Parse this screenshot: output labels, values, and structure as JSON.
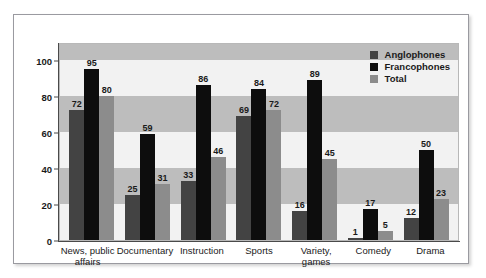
{
  "chart_data": {
    "type": "bar",
    "title": "",
    "xlabel": "",
    "ylabel": "",
    "ylim": [
      0,
      110
    ],
    "yticks": [
      0,
      20,
      40,
      60,
      80,
      100
    ],
    "grid": "horizontal-bands",
    "legend_position": "top-right",
    "categories": [
      "News, public affairs",
      "Documentary",
      "Instruction",
      "Sports",
      "Variety, games",
      "Comedy",
      "Drama"
    ],
    "category_lines": [
      [
        "News, public",
        "affairs"
      ],
      [
        "Documentary"
      ],
      [
        "Instruction"
      ],
      [
        "Sports"
      ],
      [
        "Variety,",
        "games"
      ],
      [
        "Comedy"
      ],
      [
        "Drama"
      ]
    ],
    "series": [
      {
        "name": "Anglophones",
        "color": "#434343",
        "values": [
          72,
          25,
          33,
          69,
          16,
          1,
          12
        ]
      },
      {
        "name": "Francophones",
        "color": "#0d0d0d",
        "values": [
          95,
          59,
          86,
          84,
          89,
          17,
          50
        ]
      },
      {
        "name": "Total",
        "color": "#8c8c8c",
        "values": [
          80,
          31,
          46,
          72,
          45,
          5,
          23
        ]
      }
    ]
  },
  "legend": {
    "items": [
      {
        "label": "Anglophones",
        "color": "#434343"
      },
      {
        "label": "Francophones",
        "color": "#0d0d0d"
      },
      {
        "label": "Total",
        "color": "#8c8c8c"
      }
    ]
  },
  "axis": {
    "y_ticks": [
      "0",
      "20",
      "40",
      "60",
      "80",
      "100"
    ]
  },
  "colors": {
    "plot_background": "#f2f2f2",
    "band": "#bdbdbd",
    "frame_border": "#9a9aa0",
    "axis_line": "#4a4a4a",
    "text": "#1a1a1a"
  }
}
